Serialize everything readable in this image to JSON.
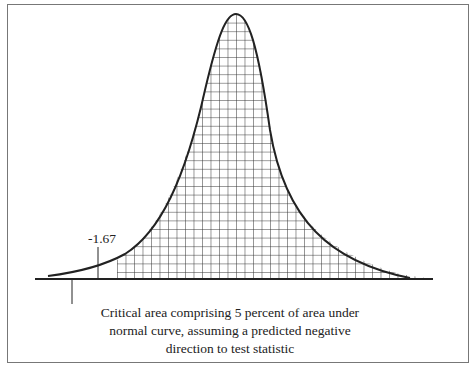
{
  "diagram": {
    "type": "normal-curve-critical-region",
    "critical_value_label": "-1.67",
    "caption_lines": [
      "Critical area comprising 5 percent of area under",
      "normal curve, assuming a predicted negative",
      "direction to test statistic"
    ],
    "colors": {
      "line": "#222222",
      "frame": "#777777",
      "background": "#ffffff"
    }
  }
}
